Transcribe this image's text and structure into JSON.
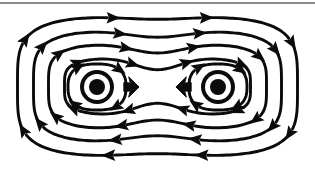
{
  "figure": {
    "title": "Magnetic field lines of two parallel conductors carrying current out of the page",
    "background_color": "#ffffff",
    "line_color": "#0b0b0b",
    "rule_color": "#8a8a8a",
    "width": 315,
    "height": 173
  },
  "top_rule": {
    "label": "horizontal divider rule",
    "y": 2,
    "thickness": 2,
    "color": "#8a8a8a"
  },
  "poles": [
    {
      "name": "left-conductor",
      "label": "current out of page",
      "symbol": "dot-in-circle",
      "cx": 97,
      "cy": 87,
      "outer_radius": 17,
      "ring_radius": 13,
      "core_radius": 8
    },
    {
      "name": "right-conductor",
      "label": "current out of page",
      "symbol": "dot-in-circle",
      "cx": 218,
      "cy": 87,
      "outer_radius": 17,
      "ring_radius": 13,
      "core_radius": 8
    }
  ],
  "force_arrows": [
    {
      "name": "left-force-arrow",
      "direction": "right",
      "label": "attractive force toward right",
      "x": 131,
      "y": 87
    },
    {
      "name": "right-force-arrow",
      "direction": "left",
      "label": "attractive force toward left",
      "x": 184,
      "y": 87
    }
  ],
  "chart_data": {
    "type": "line",
    "title": "Magnetic field lines of two parallel conductors carrying current out of the page",
    "xlabel": "",
    "ylabel": "",
    "xlim": [
      0,
      315
    ],
    "ylim": [
      0,
      173
    ],
    "grid": false,
    "legend": "none",
    "circulation": "clockwise",
    "annotations": [
      "two current-out-of-page symbols",
      "two attracting force arrows pointing inward"
    ],
    "series": [
      {
        "name": "loop-1-outermost",
        "half_width": 140,
        "half_height": 70,
        "waist": 0.96,
        "arrow_count": 8
      },
      {
        "name": "loop-2",
        "half_width": 124,
        "half_height": 56,
        "waist": 0.88,
        "arrow_count": 8
      },
      {
        "name": "loop-3",
        "half_width": 109,
        "half_height": 43,
        "waist": 0.78,
        "arrow_count": 8
      },
      {
        "name": "loop-4-innermost-shared",
        "half_width": 93,
        "half_height": 29,
        "waist": 0.58,
        "arrow_count": 8
      },
      {
        "name": "left-private-loop",
        "center_x": 97,
        "center_y": 87,
        "half_width": 29,
        "half_height": 23,
        "arrow_count": 4
      },
      {
        "name": "right-private-loop",
        "center_x": 218,
        "center_y": 87,
        "half_width": 29,
        "half_height": 23,
        "arrow_count": 4
      }
    ],
    "arrow_directions": {
      "top": "right",
      "bottom": "left",
      "left_side": "up",
      "right_side": "down"
    }
  }
}
